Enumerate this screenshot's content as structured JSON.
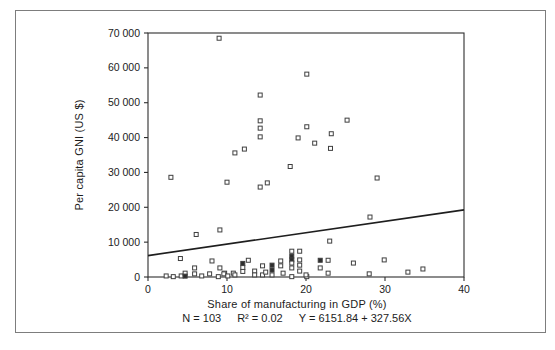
{
  "figure": {
    "background_color": "#ffffff",
    "border_color": "#7d7d7d"
  },
  "chart_data": {
    "type": "scatter",
    "title": "",
    "xlabel": "Share of manufacturing in GDP (%)",
    "ylabel": "Per capita GNI (US $)",
    "xlim": [
      0,
      40
    ],
    "ylim": [
      0,
      70000
    ],
    "grid": false,
    "legend": "none",
    "xticks": [
      0,
      10,
      20,
      30,
      40
    ],
    "xtick_labels": [
      "0",
      "10",
      "20",
      "30",
      "40"
    ],
    "yticks": [
      0,
      10000,
      20000,
      30000,
      40000,
      50000,
      60000,
      70000
    ],
    "ytick_labels": [
      "0",
      "10 000",
      "20 000",
      "30 000",
      "40 000",
      "50 000",
      "60 000",
      "70 000"
    ],
    "marker": {
      "shape": "open-square",
      "size_px": 4,
      "stroke_color": "#3f3f3f",
      "fill_color": "#ffffff",
      "overlap_fill_color": "#2d2d2d"
    },
    "axis_color": "#2e2e2e",
    "line_color": "#1e1e1e",
    "stats": {
      "n_label": "N = 103",
      "r2_label": "R² = 0.02",
      "equation": "Y = 6151.84 + 327.56X",
      "n": 103,
      "r_squared": 0.02
    },
    "regression": {
      "intercept": 6151.84,
      "slope": 327.56,
      "x_start": 0,
      "x_end": 40
    },
    "points": [
      [
        9.0,
        68500
      ],
      [
        20.1,
        58200
      ],
      [
        14.2,
        52200
      ],
      [
        25.2,
        45000
      ],
      [
        14.2,
        44800
      ],
      [
        20.1,
        43100
      ],
      [
        14.2,
        42700
      ],
      [
        23.2,
        41100
      ],
      [
        14.2,
        40200
      ],
      [
        19.0,
        39900
      ],
      [
        21.1,
        38400
      ],
      [
        23.1,
        36900
      ],
      [
        12.2,
        36700
      ],
      [
        11.0,
        35600
      ],
      [
        18.0,
        31700
      ],
      [
        2.9,
        28600
      ],
      [
        29.0,
        28400
      ],
      [
        15.1,
        27000
      ],
      [
        10.0,
        27200
      ],
      [
        14.2,
        25800
      ],
      [
        28.1,
        17200
      ],
      [
        9.1,
        13500
      ],
      [
        6.1,
        12200
      ],
      [
        23.0,
        10300
      ],
      [
        4.1,
        5300
      ],
      [
        8.1,
        4600
      ],
      [
        5.9,
        2600
      ],
      [
        9.1,
        2600
      ],
      [
        9.7,
        1100
      ],
      [
        12.0,
        3900,
        1
      ],
      [
        12.0,
        2700
      ],
      [
        12.0,
        1600
      ],
      [
        12.7,
        4800
      ],
      [
        13.5,
        1700
      ],
      [
        14.5,
        3200
      ],
      [
        15.7,
        3400,
        1
      ],
      [
        15.7,
        2000,
        1
      ],
      [
        16.8,
        4600
      ],
      [
        16.8,
        3200
      ],
      [
        17.1,
        1100
      ],
      [
        18.2,
        7400
      ],
      [
        19.2,
        7400
      ],
      [
        18.2,
        6000,
        1
      ],
      [
        18.2,
        4900,
        1
      ],
      [
        18.2,
        4000
      ],
      [
        18.2,
        2600
      ],
      [
        19.2,
        4900
      ],
      [
        19.2,
        3400
      ],
      [
        19.2,
        1700
      ],
      [
        21.8,
        4800,
        1
      ],
      [
        22.8,
        4800
      ],
      [
        21.8,
        2600
      ],
      [
        22.8,
        1100
      ],
      [
        26.0,
        4000
      ],
      [
        29.9,
        4900
      ],
      [
        34.8,
        2300
      ],
      [
        32.9,
        1400
      ],
      [
        28.0,
        900
      ],
      [
        2.3,
        300
      ],
      [
        3.2,
        100
      ],
      [
        4.2,
        300
      ],
      [
        4.7,
        1100
      ],
      [
        4.7,
        250,
        1
      ],
      [
        5.9,
        900
      ],
      [
        6.8,
        300
      ],
      [
        7.8,
        900
      ],
      [
        8.9,
        100
      ],
      [
        9.6,
        900
      ],
      [
        10.1,
        300
      ],
      [
        10.8,
        1100
      ],
      [
        11.0,
        600
      ],
      [
        13.5,
        600
      ],
      [
        14.5,
        600
      ],
      [
        14.9,
        1400
      ],
      [
        15.7,
        600
      ],
      [
        18.2,
        100
      ],
      [
        20.1,
        100
      ],
      [
        20.0,
        600
      ]
    ]
  }
}
